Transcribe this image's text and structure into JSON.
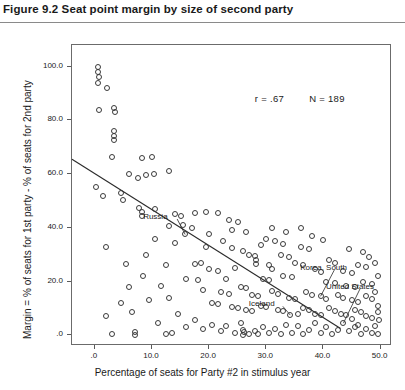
{
  "figure": {
    "title": "Figure 9.2  Seat point margin by size of second party"
  },
  "chart_data": {
    "type": "scatter",
    "title": "Figure 9.2  Seat point margin by size of second party",
    "xlabel": "Percentage of seats for Party #2 in stimulus year",
    "ylabel": "Margin = % of seats for 1st party - % of seats for 2nd party",
    "xlim": [
      -4.0,
      52.0
    ],
    "ylim": [
      -4.0,
      108.0
    ],
    "xticks": [
      0,
      10,
      20,
      30,
      40,
      50
    ],
    "xtick_labels": [
      ".0",
      "10.0",
      "20.0",
      "30.0",
      "40.0",
      "50.0"
    ],
    "yticks": [
      0,
      20,
      40,
      60,
      80,
      100
    ],
    "ytick_labels": [
      ".0",
      "20.0",
      "40.0",
      "60.0",
      "80.0",
      "100.0"
    ],
    "grid": false,
    "legend": "none",
    "marker": "open-circle",
    "annotations": [
      {
        "text": "r = .67",
        "x": 28.0,
        "y": 88.0
      },
      {
        "text": "N = 189",
        "x": 37.5,
        "y": 88.0
      }
    ],
    "statistics": {
      "r": 0.67,
      "N": 189
    },
    "point_labels": [
      {
        "label": "Russia",
        "label_x": 13.0,
        "label_y": 44.0,
        "point_x": 15.8,
        "point_y": 37.5
      },
      {
        "label": "Iceland",
        "label_x": 31.5,
        "label_y": 11.5,
        "point_x": 34.2,
        "point_y": 7.5
      },
      {
        "label": "Korea, South",
        "label_x": 40.5,
        "label_y": 25.0,
        "point_x": 39.5,
        "point_y": 14.5
      },
      {
        "label": "United States",
        "label_x": 45.0,
        "label_y": 18.0,
        "point_x": 43.5,
        "point_y": 4.5
      }
    ],
    "regression_line": {
      "x0": -4.0,
      "y0": 65.5,
      "x1": 43.0,
      "y1": 2.5
    },
    "points": [
      [
        0.5,
        100.0
      ],
      [
        0.6,
        98.0
      ],
      [
        0.7,
        96.0
      ],
      [
        0.5,
        94.0
      ],
      [
        2.2,
        92.0
      ],
      [
        0.7,
        84.0
      ],
      [
        3.4,
        84.5
      ],
      [
        3.5,
        83.0
      ],
      [
        3.3,
        76.0
      ],
      [
        3.4,
        74.0
      ],
      [
        3.4,
        72.5
      ],
      [
        8.2,
        66.0
      ],
      [
        10.0,
        66.5
      ],
      [
        6.0,
        60.0
      ],
      [
        7.5,
        58.5
      ],
      [
        9.0,
        59.5
      ],
      [
        10.3,
        60.0
      ],
      [
        13.0,
        61.0
      ],
      [
        1.5,
        52.0
      ],
      [
        5.0,
        50.5
      ],
      [
        0.2,
        55.0
      ],
      [
        3.0,
        66.5
      ],
      [
        4.5,
        53.0
      ],
      [
        7.8,
        47.5
      ],
      [
        8.2,
        46.0
      ],
      [
        8.3,
        44.5
      ],
      [
        10.5,
        47.0
      ],
      [
        14.0,
        45.0
      ],
      [
        15.0,
        44.5
      ],
      [
        17.5,
        45.5
      ],
      [
        19.5,
        46.0
      ],
      [
        21.5,
        45.5
      ],
      [
        13.0,
        40.5
      ],
      [
        15.5,
        41.0
      ],
      [
        17.0,
        40.0
      ],
      [
        23.5,
        43.0
      ],
      [
        25.0,
        42.0
      ],
      [
        24.0,
        39.0
      ],
      [
        26.5,
        38.5
      ],
      [
        10.5,
        36.0
      ],
      [
        14.0,
        34.5
      ],
      [
        19.5,
        33.0
      ],
      [
        24.0,
        32.5
      ],
      [
        26.0,
        31.5
      ],
      [
        2.0,
        33.0
      ],
      [
        15.8,
        37.5
      ],
      [
        17.5,
        26.5
      ],
      [
        18.5,
        27.0
      ],
      [
        20.0,
        24.5
      ],
      [
        21.5,
        24.0
      ],
      [
        27.0,
        30.0
      ],
      [
        28.0,
        29.5
      ],
      [
        28.2,
        28.0
      ],
      [
        28.2,
        26.5
      ],
      [
        12.5,
        26.0
      ],
      [
        16.0,
        21.0
      ],
      [
        18.0,
        20.5
      ],
      [
        30.0,
        36.0
      ],
      [
        31.5,
        35.0
      ],
      [
        33.0,
        34.0
      ],
      [
        32.5,
        30.0
      ],
      [
        34.0,
        29.0
      ],
      [
        30.5,
        26.0
      ],
      [
        31.0,
        24.5
      ],
      [
        36.0,
        33.0
      ],
      [
        37.5,
        32.0
      ],
      [
        35.0,
        27.0
      ],
      [
        36.5,
        26.0
      ],
      [
        29.5,
        21.0
      ],
      [
        30.5,
        20.5
      ],
      [
        33.0,
        22.0
      ],
      [
        34.5,
        21.5
      ],
      [
        38.5,
        24.5
      ],
      [
        39.5,
        23.5
      ],
      [
        41.0,
        28.0
      ],
      [
        42.0,
        27.0
      ],
      [
        43.5,
        24.0
      ],
      [
        45.0,
        23.0
      ],
      [
        46.0,
        26.0
      ],
      [
        47.5,
        25.5
      ],
      [
        40.5,
        20.0
      ],
      [
        42.0,
        19.5
      ],
      [
        44.0,
        18.5
      ],
      [
        45.5,
        18.0
      ],
      [
        47.0,
        20.0
      ],
      [
        48.5,
        19.0
      ],
      [
        25.5,
        18.0
      ],
      [
        26.5,
        17.5
      ],
      [
        22.0,
        16.0
      ],
      [
        23.5,
        15.5
      ],
      [
        27.5,
        15.0
      ],
      [
        28.5,
        14.5
      ],
      [
        31.0,
        16.5
      ],
      [
        32.0,
        15.5
      ],
      [
        34.0,
        14.0
      ],
      [
        35.0,
        13.5
      ],
      [
        37.0,
        16.0
      ],
      [
        38.0,
        15.0
      ],
      [
        39.5,
        14.5
      ],
      [
        40.5,
        13.5
      ],
      [
        42.5,
        15.0
      ],
      [
        43.5,
        14.0
      ],
      [
        45.0,
        13.0
      ],
      [
        46.0,
        12.5
      ],
      [
        47.5,
        14.5
      ],
      [
        48.5,
        13.5
      ],
      [
        49.0,
        16.0
      ],
      [
        49.5,
        11.0
      ],
      [
        20.5,
        12.0
      ],
      [
        21.5,
        11.5
      ],
      [
        24.0,
        10.5
      ],
      [
        25.0,
        10.0
      ],
      [
        26.5,
        9.5
      ],
      [
        27.5,
        9.0
      ],
      [
        29.0,
        11.0
      ],
      [
        30.0,
        10.5
      ],
      [
        32.0,
        9.5
      ],
      [
        33.0,
        9.0
      ],
      [
        34.2,
        7.5
      ],
      [
        35.5,
        8.0
      ],
      [
        36.5,
        10.0
      ],
      [
        37.5,
        9.5
      ],
      [
        38.5,
        8.0
      ],
      [
        39.5,
        7.5
      ],
      [
        41.0,
        10.0
      ],
      [
        42.0,
        9.0
      ],
      [
        43.0,
        8.0
      ],
      [
        44.0,
        7.5
      ],
      [
        45.5,
        9.5
      ],
      [
        46.5,
        8.5
      ],
      [
        47.5,
        7.0
      ],
      [
        48.5,
        6.5
      ],
      [
        49.5,
        8.5
      ],
      [
        49.8,
        5.5
      ],
      [
        5.5,
        26.5
      ],
      [
        6.5,
        8.5
      ],
      [
        9.5,
        13.0
      ],
      [
        11.0,
        4.5
      ],
      [
        14.5,
        8.0
      ],
      [
        16.0,
        3.0
      ],
      [
        17.5,
        5.5
      ],
      [
        19.0,
        2.5
      ],
      [
        20.5,
        4.0
      ],
      [
        22.0,
        1.5
      ],
      [
        23.0,
        3.5
      ],
      [
        24.5,
        1.0
      ],
      [
        25.5,
        4.5
      ],
      [
        26.0,
        2.0
      ],
      [
        27.0,
        0.5
      ],
      [
        28.0,
        1.5
      ],
      [
        29.5,
        3.0
      ],
      [
        30.5,
        0.8
      ],
      [
        31.5,
        2.5
      ],
      [
        32.5,
        0.5
      ],
      [
        33.5,
        4.0
      ],
      [
        34.5,
        1.0
      ],
      [
        35.5,
        3.5
      ],
      [
        36.5,
        0.6
      ],
      [
        37.5,
        2.0
      ],
      [
        38.5,
        4.5
      ],
      [
        39.5,
        1.0
      ],
      [
        40.5,
        3.0
      ],
      [
        41.5,
        0.5
      ],
      [
        42.5,
        2.0
      ],
      [
        43.5,
        4.5
      ],
      [
        44.5,
        1.5
      ],
      [
        45.5,
        3.0
      ],
      [
        46.5,
        0.5
      ],
      [
        47.5,
        2.5
      ],
      [
        48.5,
        1.0
      ],
      [
        49.0,
        3.5
      ],
      [
        49.5,
        0.4
      ],
      [
        2.0,
        7.0
      ],
      [
        3.0,
        0.3
      ],
      [
        7.0,
        0.2
      ],
      [
        7.1,
        1.2
      ],
      [
        12.5,
        0.3
      ],
      [
        13.5,
        1.0
      ],
      [
        26.0,
        0.2
      ],
      [
        26.1,
        1.2
      ],
      [
        28.5,
        0.3
      ],
      [
        4.5,
        12.0
      ],
      [
        6.0,
        18.0
      ],
      [
        8.5,
        22.0
      ],
      [
        11.5,
        18.5
      ],
      [
        13.0,
        14.0
      ],
      [
        9.0,
        30.0
      ],
      [
        20.0,
        37.5
      ],
      [
        22.5,
        35.0
      ],
      [
        23.0,
        21.0
      ],
      [
        19.0,
        17.0
      ],
      [
        24.5,
        25.0
      ],
      [
        29.0,
        33.5
      ],
      [
        31.0,
        40.0
      ],
      [
        33.5,
        38.5
      ],
      [
        36.0,
        40.0
      ],
      [
        38.0,
        37.0
      ],
      [
        40.0,
        35.5
      ],
      [
        44.5,
        32.0
      ],
      [
        47.0,
        31.0
      ],
      [
        48.0,
        29.0
      ],
      [
        49.0,
        27.0
      ],
      [
        49.5,
        22.0
      ],
      [
        45.0,
        6.0
      ],
      [
        46.0,
        4.0
      ]
    ]
  }
}
